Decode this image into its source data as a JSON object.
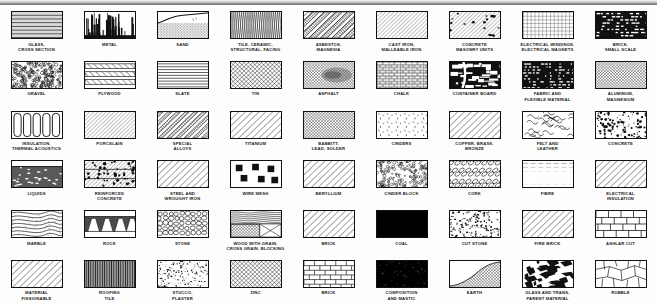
{
  "layout": {
    "columns": 9,
    "rows": 6,
    "swatch_width_px": 52,
    "swatch_height_px": 28
  },
  "colors": {
    "background": "#fdfdfd",
    "ink": "#111111",
    "label_text": "#1a1a1a",
    "top_band": "#6f6f6f"
  },
  "materials": [
    {
      "label": "GLASS,\nCROSS SECTION",
      "pattern": "glass-cross-section"
    },
    {
      "label": "METAL",
      "pattern": "metal"
    },
    {
      "label": "SAND",
      "pattern": "sand"
    },
    {
      "label": "TILE, CERAMIC,\nSTRUCTURAL, FACING",
      "pattern": "tile-ceramic"
    },
    {
      "label": "ASBESTOS,\nMAGNESIA",
      "pattern": "asbestos"
    },
    {
      "label": "CAST IRON,\nMALLEABLE IRON",
      "pattern": "cast-iron"
    },
    {
      "label": "CONCRETE\nMASONRY UNITS",
      "pattern": "concrete-masonry-units"
    },
    {
      "label": "ELECTRICAL WINDINGS,\nELECTRICAL MAGNETS",
      "pattern": "electrical-windings"
    },
    {
      "label": "BRICK,\nSMALL SCALE",
      "pattern": "brick-small-scale"
    },
    {
      "label": "GRAVEL",
      "pattern": "gravel"
    },
    {
      "label": "PLYWOOD",
      "pattern": "plywood"
    },
    {
      "label": "SLATE",
      "pattern": "slate"
    },
    {
      "label": "TIN",
      "pattern": "tin"
    },
    {
      "label": "ASPHALT",
      "pattern": "asphalt"
    },
    {
      "label": "CHALK",
      "pattern": "chalk"
    },
    {
      "label": "CONTAINER BOARD",
      "pattern": "container-board"
    },
    {
      "label": "FABRIC AND\nFLEXIBLE MATERIAL",
      "pattern": "fabric-flexible"
    },
    {
      "label": "ALUMINUM,\nMAGNESIUM",
      "pattern": "aluminum-magnesium"
    },
    {
      "label": "INSULATION,\nTHERMAL ACOUSTICS",
      "pattern": "insulation-thermal"
    },
    {
      "label": "PORCELAIN",
      "pattern": "porcelain"
    },
    {
      "label": "SPECIAL\nALLOYS",
      "pattern": "special-alloys"
    },
    {
      "label": "TITANIUM",
      "pattern": "titanium"
    },
    {
      "label": "BABBITT,\nLEAD, SOLDER",
      "pattern": "babbitt-lead-solder"
    },
    {
      "label": "CINDERS",
      "pattern": "cinders"
    },
    {
      "label": "COPPER, BRASS,\nBRONZE",
      "pattern": "copper-brass-bronze"
    },
    {
      "label": "FELT AND\nLEATHER",
      "pattern": "felt-leather"
    },
    {
      "label": "CONCRETE",
      "pattern": "concrete"
    },
    {
      "label": "LIQUIDS",
      "pattern": "liquids"
    },
    {
      "label": "REINFORCED\nCONCRETE",
      "pattern": "reinforced-concrete"
    },
    {
      "label": "STEEL AND\nWROUGHT IRON",
      "pattern": "steel-wrought-iron"
    },
    {
      "label": "WIRE MESH",
      "pattern": "wire-mesh"
    },
    {
      "label": "BERYLLIUM",
      "pattern": "beryllium"
    },
    {
      "label": "CINDER BLOCK",
      "pattern": "cinder-block"
    },
    {
      "label": "CORK",
      "pattern": "cork"
    },
    {
      "label": "FIBRE",
      "pattern": "fibre"
    },
    {
      "label": "ELECTRICAL\nINSULATION",
      "pattern": "electrical-insulation"
    },
    {
      "label": "MARBLE",
      "pattern": "marble"
    },
    {
      "label": "ROCK",
      "pattern": "rock"
    },
    {
      "label": "STONE",
      "pattern": "stone"
    },
    {
      "label": "WOOD WITH GRAIN,\nCROSS GRAIN, BLOCKING",
      "pattern": "wood-with-grain"
    },
    {
      "label": "BRICK",
      "pattern": "brick-diagonal"
    },
    {
      "label": "COAL",
      "pattern": "coal"
    },
    {
      "label": "CUT STONE",
      "pattern": "cut-stone"
    },
    {
      "label": "FIRE BRICK",
      "pattern": "fire-brick"
    },
    {
      "label": "ASHLAR CUT",
      "pattern": "ashlar-cut"
    },
    {
      "label": "MATERIAL\nFISSIONABLE",
      "pattern": "material-fissionable"
    },
    {
      "label": "ROOFING\nTILE",
      "pattern": "roofing-tile"
    },
    {
      "label": "STUCCO,\nPLASTER",
      "pattern": "stucco-plaster"
    },
    {
      "label": "ZINC",
      "pattern": "zinc"
    },
    {
      "label": "BRICK",
      "pattern": "brick-running-bond"
    },
    {
      "label": "COMPOSITION\nAND MASTIC",
      "pattern": "composition-mastic"
    },
    {
      "label": "EARTH",
      "pattern": "earth"
    },
    {
      "label": "GLASS AND TRANS-\nPARENT MATERIAL",
      "pattern": "glass-transparent"
    },
    {
      "label": "RUBBLE",
      "pattern": "rubble"
    }
  ]
}
